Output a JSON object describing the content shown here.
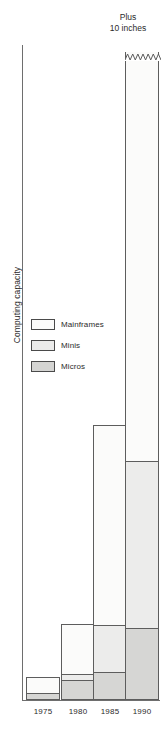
{
  "chart_data": {
    "type": "bar",
    "subtype": "stacked-bar",
    "title": "",
    "xlabel": "",
    "ylabel": "Computing capacity",
    "categories": [
      "1975",
      "1980",
      "1985",
      "1990"
    ],
    "grid": false,
    "legend_position": "inside-left",
    "y_axis_ticks": [],
    "note": "y-axis is unlabeled/qualitative; 1990 bar is truncated with a jagged break",
    "annotations": [
      {
        "text_line1": "Plus",
        "text_line2": "10 inches",
        "target": "1990",
        "position": "above-bar"
      }
    ],
    "series": [
      {
        "name": "Mainframes",
        "color": "#fbfbfa",
        "values": [
          17,
          50,
          200,
          410
        ]
      },
      {
        "name": "Minis",
        "color": "#ececeb",
        "values": [
          0,
          6,
          48,
          167
        ]
      },
      {
        "name": "Micros",
        "color": "#d6d6d4",
        "values": [
          6,
          20,
          27,
          71
        ]
      }
    ],
    "bar_totals": [
      23,
      76,
      275,
      648
    ]
  },
  "annotation": {
    "line1": "Plus",
    "line2": "10 inches"
  },
  "axes": {
    "y_title": "Computing capacity",
    "x_ticks": [
      "1975",
      "1980",
      "1985",
      "1990"
    ]
  },
  "legend": {
    "items": [
      {
        "label": "Mainframes",
        "key": "mainframes"
      },
      {
        "label": "Minis",
        "key": "minis"
      },
      {
        "label": "Micros",
        "key": "micros"
      }
    ]
  }
}
